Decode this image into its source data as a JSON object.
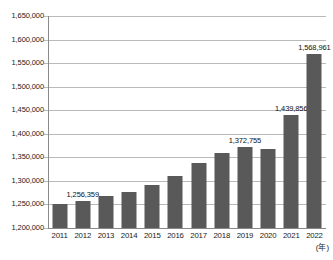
{
  "chart_data": {
    "type": "bar",
    "title": "",
    "subtitle": "",
    "xlabel": "(年)",
    "ylabel": "",
    "categories": [
      "2011",
      "2012",
      "2013",
      "2014",
      "2015",
      "2016",
      "2017",
      "2018",
      "2019",
      "2020",
      "2021",
      "2022"
    ],
    "values": [
      1252000,
      1256359,
      1268000,
      1276000,
      1291000,
      1310000,
      1338000,
      1360000,
      1372755,
      1368000,
      1439856,
      1568961
    ],
    "value_labels": [
      {
        "category": "2012",
        "text": "1,256,359",
        "value": 1256359
      },
      {
        "category": "2019",
        "text": "1,372,755",
        "value": 1372755
      },
      {
        "category": "2021",
        "text": "1,439,856",
        "value": 1439856
      },
      {
        "category": "2022",
        "text": "1,568,961",
        "value": 1568961
      }
    ],
    "ylim": [
      1200000,
      1650000
    ],
    "ytick_step": 50000,
    "ytick_labels": [
      "1,650,000",
      "1,600,000",
      "1,550,000",
      "1,500,000",
      "1,450,000",
      "1,400,000",
      "1,350,000",
      "1,300,000",
      "1,250,000",
      "1,200,000"
    ],
    "ytick_values": [
      1650000,
      1600000,
      1550000,
      1500000,
      1450000,
      1400000,
      1350000,
      1300000,
      1250000,
      1200000
    ],
    "grid": true,
    "legend": null,
    "legend_position": "none",
    "colors": {
      "bar": "#595959",
      "gridline": "#b9b9b9",
      "axis": "#8a8a8a",
      "text": "#1a1a1a",
      "background": "#ffffff"
    }
  }
}
